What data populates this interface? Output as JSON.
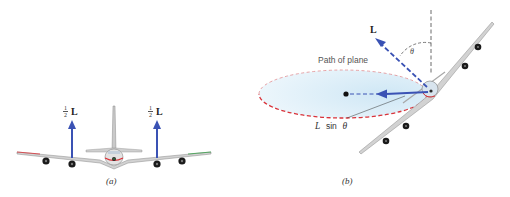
{
  "figure": {
    "panels": [
      {
        "id": "a",
        "caption": "(a)",
        "description": "Front view of an airplane in level flight with lift split equally between the two wings",
        "forces": [
          {
            "label_fraction_num": "1",
            "label_fraction_den": "2",
            "label_symbol": "L",
            "side": "left"
          },
          {
            "label_fraction_num": "1",
            "label_fraction_den": "2",
            "label_symbol": "L",
            "side": "right"
          }
        ]
      },
      {
        "id": "b",
        "caption": "(b)",
        "description": "Banked airplane moving in a horizontal circle; lift L tilted by angle theta from vertical",
        "path_label": "Path of plane",
        "lift_label": "L",
        "angle_label": "θ",
        "component_label_L": "L",
        "component_label_sin": "sin",
        "component_label_theta": "θ"
      }
    ],
    "colors": {
      "force_arrow": "#3a52b4",
      "path_dashed": "#d9333a",
      "path_fill": "#e3f1fa",
      "plane_body": "#c8c8c8",
      "plane_outline": "#8a8a8a",
      "engine": "#1a1a1a",
      "vertical_ref": "#444444"
    }
  }
}
